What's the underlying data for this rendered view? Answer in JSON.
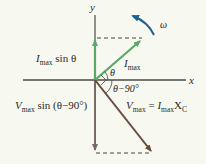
{
  "diagram": {
    "type": "phasor-diagram",
    "axes": {
      "x_label": "x",
      "y_label": "y"
    },
    "vectors": [
      {
        "name": "current-phasor",
        "label_main": "I",
        "label_sub": "max",
        "angle": "θ",
        "color": "#5aa86a"
      },
      {
        "name": "voltage-phasor",
        "label_main": "V",
        "label_sub": "max",
        "angle": "θ−90°",
        "color": "#6b4a3e"
      }
    ],
    "projections": {
      "current": {
        "main": "I",
        "sub": "max",
        "rest": " sin θ"
      },
      "voltage": {
        "main": "V",
        "sub": "max",
        "rest": " sin (θ−90°)"
      }
    },
    "equation": {
      "lhs_main": "V",
      "lhs_sub": "max",
      "eq": " = ",
      "rhs_main": "I",
      "rhs_sub": "max",
      "rhs_x": "X",
      "rhs_x_sub": "C"
    },
    "angles": {
      "theta": "θ",
      "theta_minus_90": "θ−90°"
    },
    "rotation": {
      "label": "ω",
      "color": "#1f5f8f"
    },
    "colors": {
      "background": "#f7f8ef",
      "axis": "#4a4a4a",
      "current": "#5aa86a",
      "voltage": "#6b4a3e",
      "voltage_projection": "#7a6a66",
      "dashed": "#444444",
      "omega": "#1f5f8f"
    }
  }
}
